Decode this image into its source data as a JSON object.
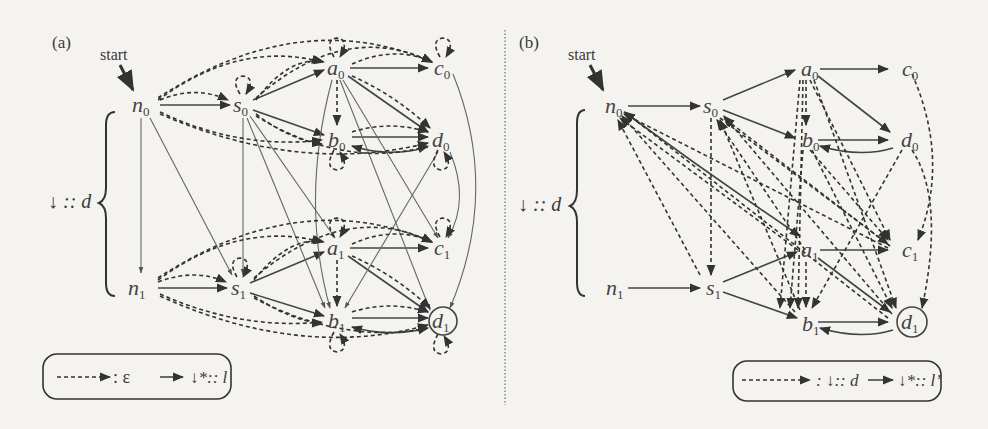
{
  "panel_a": {
    "label": "(a)",
    "start_label": "start",
    "brace_label": "↓ :: d",
    "nodes": [
      {
        "id": "n0",
        "base": "n",
        "sub": "0"
      },
      {
        "id": "s0",
        "base": "s",
        "sub": "0"
      },
      {
        "id": "a0",
        "base": "a",
        "sub": "0"
      },
      {
        "id": "c0",
        "base": "c",
        "sub": "0"
      },
      {
        "id": "b0",
        "base": "b",
        "sub": "0"
      },
      {
        "id": "d0",
        "base": "d",
        "sub": "0"
      },
      {
        "id": "n1",
        "base": "n",
        "sub": "1"
      },
      {
        "id": "s1",
        "base": "s",
        "sub": "1"
      },
      {
        "id": "a1",
        "base": "a",
        "sub": "1"
      },
      {
        "id": "c1",
        "base": "c",
        "sub": "1"
      },
      {
        "id": "b1",
        "base": "b",
        "sub": "1"
      },
      {
        "id": "d1",
        "base": "d",
        "sub": "1",
        "accepting": true
      }
    ],
    "legend": {
      "dashed_meaning": ": ε",
      "solid_meaning": "↓*:: l"
    }
  },
  "panel_b": {
    "label": "(b)",
    "start_label": "start",
    "brace_label": "↓ :: d",
    "nodes": [
      {
        "id": "n0",
        "base": "n",
        "sub": "0"
      },
      {
        "id": "s0",
        "base": "s",
        "sub": "0"
      },
      {
        "id": "a0",
        "base": "a",
        "sub": "0"
      },
      {
        "id": "c0",
        "base": "c",
        "sub": "0"
      },
      {
        "id": "b0",
        "base": "b",
        "sub": "0"
      },
      {
        "id": "d0",
        "base": "d",
        "sub": "0"
      },
      {
        "id": "n1",
        "base": "n",
        "sub": "1"
      },
      {
        "id": "s1",
        "base": "s",
        "sub": "1"
      },
      {
        "id": "a1",
        "base": "a",
        "sub": "1"
      },
      {
        "id": "c1",
        "base": "c",
        "sub": "1"
      },
      {
        "id": "b1",
        "base": "b",
        "sub": "1"
      },
      {
        "id": "d1",
        "base": "d",
        "sub": "1",
        "accepting": true
      }
    ],
    "legend": {
      "dashed_meaning": ": ↓:: d",
      "solid_meaning": "↓*:: l’"
    }
  }
}
